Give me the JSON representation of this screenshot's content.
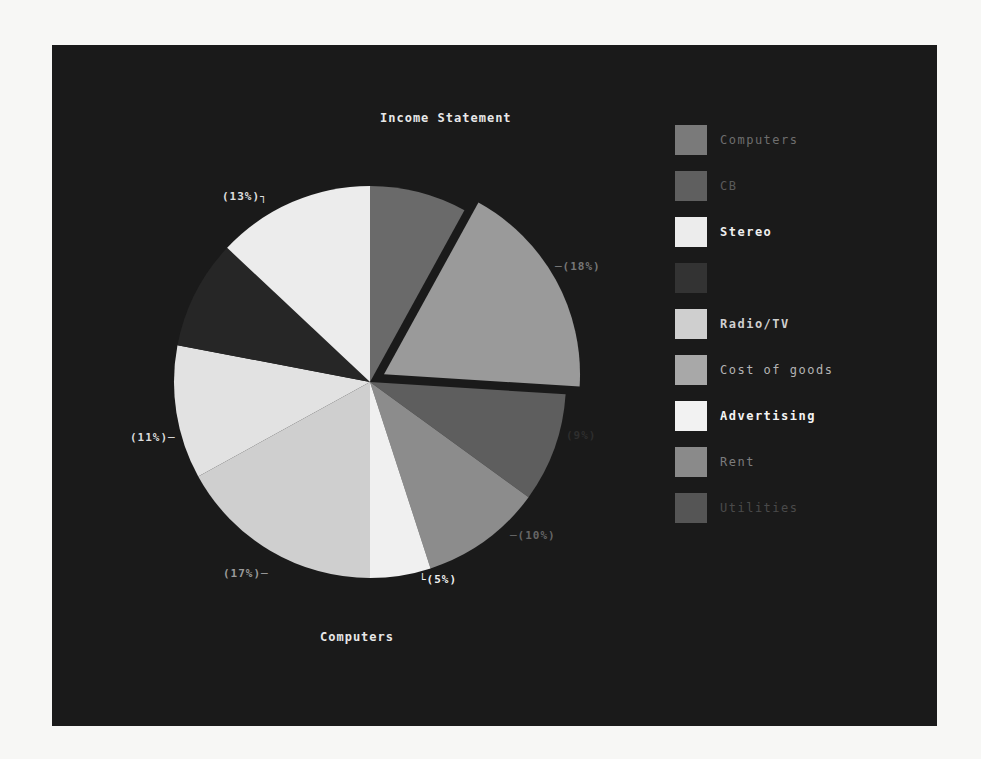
{
  "chart_data": {
    "type": "pie",
    "title": "Income Statement",
    "subtitle": "Computers",
    "exploded_slice": "Cost of goods",
    "slices": [
      {
        "label": "Computers",
        "value": 8,
        "pct_label": "",
        "color": "#6a6a6a"
      },
      {
        "label": "Cost of goods",
        "value": 18,
        "pct_label": "(18%)",
        "color": "#9a9a9a"
      },
      {
        "label": "Rent",
        "value": 9,
        "pct_label": "(9%)",
        "color": "#5e5e5e"
      },
      {
        "label": "Utilities",
        "value": 10,
        "pct_label": "(10%)",
        "color": "#8c8c8c"
      },
      {
        "label": "Advertising",
        "value": 5,
        "pct_label": "(5%)",
        "color": "#f0f0f0"
      },
      {
        "label": "Radio/TV",
        "value": 17,
        "pct_label": "(17%)",
        "color": "#cfcfcf"
      },
      {
        "label": "Stereo",
        "value": 11,
        "pct_label": "(11%)",
        "color": "#e2e2e2"
      },
      {
        "label": "CB",
        "value": 9,
        "pct_label": "",
        "color": "#262626"
      },
      {
        "label": "Stereo",
        "value": 13,
        "pct_label": "(13%)",
        "color": "#ececec"
      }
    ],
    "legend_position": "right"
  },
  "chart": {
    "title": "Income Statement",
    "subtitle": "Computers",
    "pct_labels": {
      "cost_of_goods": "─(18%)",
      "rent": "(9%)",
      "utilities": "─(10%)",
      "advertising": "└(5%)",
      "radio_tv": "(17%)─",
      "stereo_left": "(11%)─",
      "stereo_top": "(13%)┐"
    }
  },
  "legend": {
    "items": [
      {
        "label": "Computers",
        "color": "#7a7a7a",
        "text_color": "#6e6e6e"
      },
      {
        "label": "CB",
        "color": "#5f5f5f",
        "text_color": "#5a5a5a"
      },
      {
        "label": "Stereo",
        "color": "#ececec",
        "text_color": "#efefef"
      },
      {
        "label": "",
        "color": "#333333",
        "text_color": "#333333"
      },
      {
        "label": "Radio/TV",
        "color": "#cfcfcf",
        "text_color": "#cfcfcf"
      },
      {
        "label": "Cost of goods",
        "color": "#a8a8a8",
        "text_color": "#b4b4b4"
      },
      {
        "label": "Advertising",
        "color": "#f2f2f2",
        "text_color": "#f4f4f4"
      },
      {
        "label": "Rent",
        "color": "#8a8a8a",
        "text_color": "#7c7c7c"
      },
      {
        "label": "Utilities",
        "color": "#555555",
        "text_color": "#4a4a4a"
      }
    ]
  }
}
